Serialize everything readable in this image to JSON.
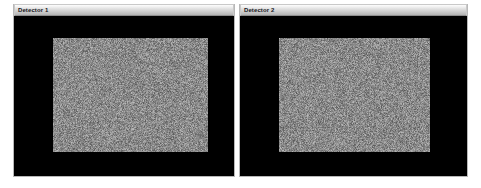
{
  "app": {
    "background_color": "#ffffff",
    "canvas_width": 481,
    "canvas_height": 188
  },
  "panels": [
    {
      "id": "detector-1",
      "title": "Detector 1",
      "titlebar_color": "#dcdcdc",
      "body_color": "#000000",
      "border_color": "#b8b8b8",
      "frame": {
        "x": 13,
        "y": 4,
        "width": 222,
        "height": 173
      },
      "image": {
        "name": "detector-1-noise-image",
        "type": "noise",
        "mean_gray": "#8a8a8a",
        "x": 39,
        "y": 22,
        "width": 155,
        "height": 114
      }
    },
    {
      "id": "detector-2",
      "title": "Detector 2",
      "titlebar_color": "#dcdcdc",
      "body_color": "#000000",
      "border_color": "#b8b8b8",
      "frame": {
        "x": 239,
        "y": 4,
        "width": 229,
        "height": 173
      },
      "image": {
        "name": "detector-2-noise-image",
        "type": "noise",
        "mean_gray": "#8a8a8a",
        "x": 39,
        "y": 22,
        "width": 151,
        "height": 114
      }
    }
  ]
}
